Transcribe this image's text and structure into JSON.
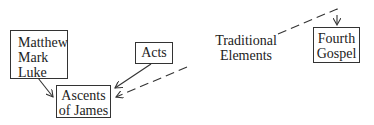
{
  "diagram": {
    "nodes": [
      {
        "id": "synoptics",
        "lines": [
          "Matthew",
          "Mark",
          "Luke"
        ]
      },
      {
        "id": "ascents",
        "lines": [
          "Ascents",
          "of James"
        ]
      },
      {
        "id": "acts",
        "lines": [
          "Acts"
        ]
      },
      {
        "id": "fourth_gospel",
        "lines": [
          "Fourth",
          "Gospel"
        ]
      }
    ],
    "free_label": {
      "id": "traditional_elements",
      "lines": [
        "Traditional",
        "Elements"
      ]
    },
    "edges": [
      {
        "from": "synoptics",
        "to": "ascents",
        "style": "solid"
      },
      {
        "from": "acts",
        "to": "ascents",
        "style": "solid"
      },
      {
        "from": "traditional_elements",
        "to": "ascents",
        "style": "dashed"
      },
      {
        "from": "traditional_elements",
        "to": "fourth_gospel",
        "style": "dashed"
      }
    ],
    "colors": {
      "line": "#333333",
      "background": "#ffffff"
    }
  }
}
